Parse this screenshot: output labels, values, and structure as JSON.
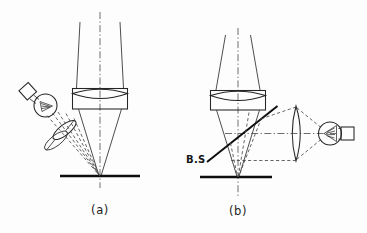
{
  "figure": {
    "background_color": "#fdfdfd",
    "ink_color": "#202020",
    "panels": [
      {
        "id": "a",
        "caption": "(a)",
        "description": "Oblique external illumination: lamp and tilted condenser lens directing a dashed ray bundle onto the specimen plane beneath the objective lens.",
        "components": [
          {
            "name": "lamp-bulb",
            "label": "",
            "shape": "circle-with-square-base-and-triangular-filament"
          },
          {
            "name": "condenser-lens",
            "label": "",
            "shape": "tilted-elliptical-lens"
          },
          {
            "name": "objective-lens",
            "label": "",
            "shape": "biconvex-lens-in-rectangular-mount"
          },
          {
            "name": "specimen-plane",
            "label": "",
            "shape": "thick-horizontal-line"
          },
          {
            "name": "optical-axis",
            "label": "",
            "shape": "dash-dot-vertical-line"
          },
          {
            "name": "illumination-rays",
            "label": "",
            "shape": "dashed-converging-bundle"
          },
          {
            "name": "imaging-rays",
            "label": "",
            "shape": "solid-converging-cone"
          }
        ]
      },
      {
        "id": "b",
        "caption": "(b)",
        "description": "Epi-illumination through a beam splitter: lamp and condenser on the right, beam splitter folding the illumination down through the objective onto the specimen.",
        "beam_splitter_label": "B.S",
        "components": [
          {
            "name": "lamp-bulb",
            "label": "",
            "shape": "circle-with-square-base-and-triangular-filament"
          },
          {
            "name": "condenser-lens",
            "label": "",
            "shape": "vertical-biconvex-lens"
          },
          {
            "name": "beam-splitter",
            "label": "B.S",
            "shape": "thick-diagonal-line"
          },
          {
            "name": "objective-lens",
            "label": "",
            "shape": "biconvex-lens-in-rectangular-mount"
          },
          {
            "name": "specimen-plane",
            "label": "",
            "shape": "thick-horizontal-line"
          },
          {
            "name": "vertical-optical-axis",
            "label": "",
            "shape": "dash-dot-vertical-line"
          },
          {
            "name": "horizontal-optical-axis",
            "label": "",
            "shape": "dash-dot-horizontal-line"
          },
          {
            "name": "illumination-rays",
            "label": "",
            "shape": "dashed-converging-bundle"
          },
          {
            "name": "imaging-rays",
            "label": "",
            "shape": "solid-converging-cone"
          }
        ]
      }
    ]
  }
}
